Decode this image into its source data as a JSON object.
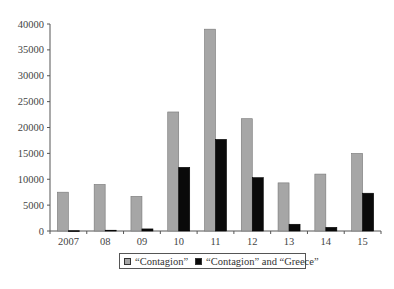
{
  "chart_data": {
    "type": "bar",
    "title": "",
    "xlabel": "",
    "ylabel": "",
    "categories": [
      "2007",
      "08",
      "09",
      "10",
      "11",
      "12",
      "13",
      "14",
      "15"
    ],
    "series": [
      {
        "name": "“Contagion”",
        "color": "#a6a6a6",
        "values": [
          7500,
          9000,
          6700,
          23000,
          39000,
          21700,
          9300,
          11000,
          15000
        ]
      },
      {
        "name": "“Contagion” and “Greece”",
        "color": "#0a0a0a",
        "values": [
          50,
          150,
          400,
          12300,
          17700,
          10300,
          1300,
          700,
          7300
        ]
      }
    ],
    "ylim": [
      0,
      40000
    ],
    "yticks": [
      0,
      5000,
      10000,
      15000,
      20000,
      25000,
      30000,
      35000,
      40000
    ],
    "grid": false,
    "legend_position": "bottom"
  },
  "legend": {
    "items": [
      {
        "label": "“Contagion”",
        "color": "#a6a6a6"
      },
      {
        "label": "“Contagion” and “Greece”",
        "color": "#0a0a0a"
      }
    ]
  }
}
